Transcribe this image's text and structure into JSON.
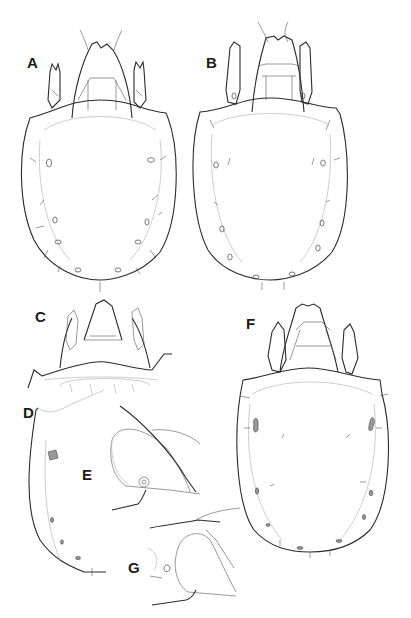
{
  "figure": {
    "type": "scientific-illustration",
    "background": "#ffffff",
    "line_color": "#2a2a2a",
    "panels": [
      {
        "label": "A",
        "view": "dorsal habitus"
      },
      {
        "label": "B",
        "view": "dorsal habitus"
      },
      {
        "label": "C",
        "view": "prodorsum detail"
      },
      {
        "label": "D",
        "view": "notogaster lateral half"
      },
      {
        "label": "E",
        "view": "leg/pedotectum detail"
      },
      {
        "label": "F",
        "view": "dorsal habitus"
      },
      {
        "label": "G",
        "view": "leg/pedotectum detail"
      }
    ]
  }
}
